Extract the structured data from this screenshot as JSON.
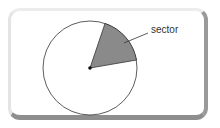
{
  "diagram": {
    "label": "sector",
    "sector_color": "#8a8a8a",
    "circle_stroke": "#333333"
  }
}
